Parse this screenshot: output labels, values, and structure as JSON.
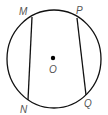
{
  "diagram": {
    "type": "circle-with-chords",
    "center_label": "O",
    "points": {
      "M": "M",
      "N": "N",
      "P": "P",
      "Q": "Q"
    },
    "chords": [
      "MN",
      "PQ"
    ],
    "colors": {
      "stroke": "#111111",
      "label": "#555555"
    }
  }
}
